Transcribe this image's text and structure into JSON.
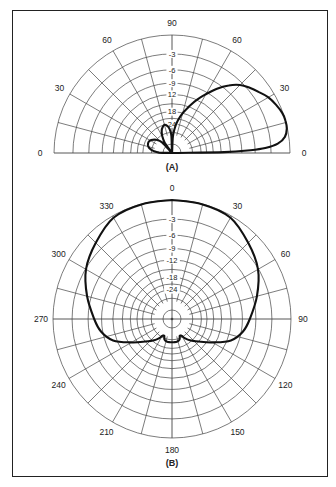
{
  "chart_data": [
    {
      "type": "polar",
      "id": "A",
      "caption": "(A)",
      "title": "Elevation pattern",
      "half_plane": true,
      "angle_unit": "degrees",
      "radial_unit": "dB",
      "radial_scale": "ARRL log-periodic (r = 0.89^(|dB|/2))",
      "angle_tick_labels": [
        {
          "angle": 0,
          "text": "0",
          "side": "right"
        },
        {
          "angle": 30,
          "text": "30"
        },
        {
          "angle": 60,
          "text": "60"
        },
        {
          "angle": 90,
          "text": "90"
        },
        {
          "angle": 120,
          "text": "60"
        },
        {
          "angle": 150,
          "text": "30"
        },
        {
          "angle": 180,
          "text": "0",
          "side": "left"
        }
      ],
      "radial_tick_labels": [
        "-3",
        "-6",
        "-9",
        "12",
        "18",
        "24"
      ],
      "radial_rings_db": [
        0,
        -3,
        -6,
        -9,
        -12,
        -15,
        -18,
        -21,
        -24,
        -30
      ],
      "spoke_step_deg": 15,
      "series": [
        {
          "name": "pattern",
          "points": [
            [
              0,
              -40
            ],
            [
              1,
              -14
            ],
            [
              2,
              -7
            ],
            [
              3,
              -4
            ],
            [
              5,
              -1.8
            ],
            [
              8,
              -0.6
            ],
            [
              12,
              -0.1
            ],
            [
              16,
              0
            ],
            [
              20,
              -0.1
            ],
            [
              25,
              -0.5
            ],
            [
              30,
              -1.0
            ],
            [
              35,
              -1.8
            ],
            [
              40,
              -2.6
            ],
            [
              45,
              -3.5
            ],
            [
              50,
              -5.0
            ],
            [
              55,
              -7.0
            ],
            [
              60,
              -9.5
            ],
            [
              65,
              -12
            ],
            [
              70,
              -15
            ],
            [
              75,
              -18
            ],
            [
              80,
              -22
            ],
            [
              84,
              -27
            ],
            [
              87,
              -34
            ],
            [
              89,
              -40
            ],
            [
              92,
              -33
            ],
            [
              96,
              -27
            ],
            [
              100,
              -25
            ],
            [
              105,
              -24
            ],
            [
              110,
              -25
            ],
            [
              115,
              -27
            ],
            [
              120,
              -31
            ],
            [
              125,
              -38
            ],
            [
              128,
              -40
            ],
            [
              133,
              -36
            ],
            [
              140,
              -30
            ],
            [
              148,
              -27
            ],
            [
              155,
              -26
            ],
            [
              162,
              -26.5
            ],
            [
              168,
              -28
            ],
            [
              174,
              -32
            ],
            [
              178,
              -38
            ],
            [
              180,
              -40
            ]
          ]
        }
      ]
    },
    {
      "type": "polar",
      "id": "B",
      "caption": "(B)",
      "title": "Azimuth pattern",
      "half_plane": false,
      "angle_unit": "degrees",
      "radial_unit": "dB",
      "radial_scale": "ARRL log-periodic (r = 0.89^(|dB|/2))",
      "angle_tick_labels": [
        {
          "angle": 0,
          "text": "0"
        },
        {
          "angle": 30,
          "text": "30"
        },
        {
          "angle": 60,
          "text": "60"
        },
        {
          "angle": 90,
          "text": "90"
        },
        {
          "angle": 120,
          "text": "120"
        },
        {
          "angle": 150,
          "text": "150"
        },
        {
          "angle": 180,
          "text": "180"
        },
        {
          "angle": 210,
          "text": "210"
        },
        {
          "angle": 240,
          "text": "240"
        },
        {
          "angle": 270,
          "text": "270"
        },
        {
          "angle": 300,
          "text": "300"
        },
        {
          "angle": 330,
          "text": "330"
        }
      ],
      "radial_tick_labels": [
        "-3",
        "-6",
        "-9",
        "-12",
        "-18",
        "-24"
      ],
      "radial_rings_db": [
        0,
        -3,
        -6,
        -9,
        -12,
        -15,
        -18,
        -21,
        -24,
        -30
      ],
      "spoke_step_deg": 15,
      "series": [
        {
          "name": "pattern",
          "points": [
            [
              0,
              0
            ],
            [
              15,
              -0.05
            ],
            [
              30,
              -0.3
            ],
            [
              45,
              -1.7
            ],
            [
              60,
              -3.1
            ],
            [
              75,
              -5.2
            ],
            [
              90,
              -7.3
            ],
            [
              100,
              -8.6
            ],
            [
              110,
              -11
            ],
            [
              120,
              -16
            ],
            [
              130,
              -21
            ],
            [
              140,
              -25
            ],
            [
              146,
              -28
            ],
            [
              150,
              -31
            ],
            [
              155,
              -32
            ],
            [
              160,
              -29
            ],
            [
              168,
              -28
            ],
            [
              175,
              -28
            ],
            [
              180,
              -28
            ],
            [
              185,
              -28
            ],
            [
              192,
              -28
            ],
            [
              200,
              -29
            ],
            [
              205,
              -32
            ],
            [
              210,
              -31
            ],
            [
              214,
              -28
            ],
            [
              220,
              -25
            ],
            [
              230,
              -21
            ],
            [
              240,
              -16
            ],
            [
              250,
              -11
            ],
            [
              260,
              -8.6
            ],
            [
              270,
              -7.3
            ],
            [
              285,
              -5.2
            ],
            [
              300,
              -3.1
            ],
            [
              315,
              -1.7
            ],
            [
              330,
              -0.3
            ],
            [
              345,
              -0.05
            ],
            [
              360,
              0
            ]
          ]
        }
      ]
    }
  ]
}
